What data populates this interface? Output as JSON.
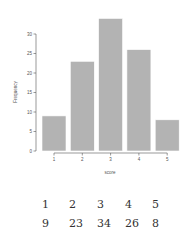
{
  "chart_data": {
    "type": "bar",
    "title": "",
    "xlabel": "score",
    "ylabel": "Frequency",
    "categories": [
      "1",
      "2",
      "3",
      "4",
      "5"
    ],
    "values": [
      9,
      23,
      34,
      26,
      8
    ],
    "ylim": [
      0,
      35
    ],
    "yticks": [
      0,
      5,
      10,
      15,
      20,
      25,
      30
    ],
    "grid": false,
    "legend": null,
    "bar_color": "#b3b3b3",
    "bar_edge_color": "#ffffff"
  },
  "table": {
    "row1": [
      "1",
      "2",
      "3",
      "4",
      "5"
    ],
    "row2": [
      "9",
      "23",
      "34",
      "26",
      "8"
    ]
  }
}
